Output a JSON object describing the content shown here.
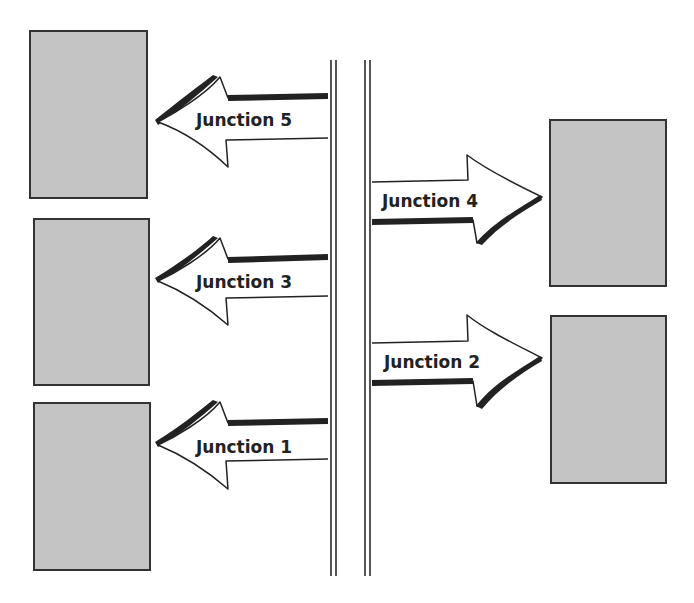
{
  "diagram": {
    "colors": {
      "building_fill": "#c4c4c4",
      "building_border": "#333333",
      "arrow_outline": "#222222",
      "road_line": "#555555"
    },
    "left_buildings": [
      "",
      "",
      ""
    ],
    "right_buildings": [
      "",
      ""
    ],
    "junctions": [
      {
        "label": "Junction 5",
        "direction": "left"
      },
      {
        "label": "Junction 4",
        "direction": "right"
      },
      {
        "label": "Junction 3",
        "direction": "left"
      },
      {
        "label": "Junction 2",
        "direction": "right"
      },
      {
        "label": "Junction 1",
        "direction": "left"
      }
    ]
  }
}
